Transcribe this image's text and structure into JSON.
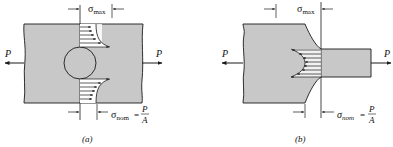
{
  "figure": {
    "colors": {
      "plate_fill": "#c8c8c8",
      "line": "#1a1a1a",
      "background": "#ffffff"
    },
    "panel_a": {
      "caption": "(a)",
      "load_left": "P",
      "load_right": "P",
      "sigma_max_symbol": "σ",
      "sigma_max_sub": "max",
      "sigma_nom_symbol": "σ",
      "sigma_nom_sub": "nom",
      "equals": "=",
      "frac_num": "P",
      "frac_den": "A",
      "feature": "circular hole"
    },
    "panel_b": {
      "caption": "(b)",
      "load_left": "P",
      "load_right": "P",
      "sigma_max_symbol": "σ",
      "sigma_max_sub": "max",
      "sigma_nom_symbol": "σ",
      "sigma_nom_sub": "nom",
      "equals": "=",
      "frac_num": "P",
      "frac_den": "A",
      "feature": "shoulder fillet"
    }
  }
}
